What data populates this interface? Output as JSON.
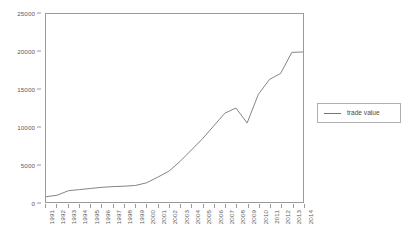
{
  "chart_data": {
    "type": "line",
    "title": "",
    "xlabel": "",
    "ylabel": "",
    "grid": false,
    "legend_position": "right",
    "ylim": [
      0,
      25000
    ],
    "ytick_labels": [
      "25000",
      "20000",
      "15000",
      "10000",
      "5000",
      "0"
    ],
    "ytick_values": [
      25000,
      20000,
      15000,
      10000,
      5000,
      0
    ],
    "categories": [
      "1991",
      "1992",
      "1993",
      "1994",
      "1995",
      "1996",
      "1997",
      "1998",
      "1999",
      "2000",
      "2001",
      "2002",
      "2003",
      "2004",
      "2005",
      "2006",
      "2007",
      "2008",
      "2009",
      "2010",
      "2011",
      "2012",
      "2013",
      "2014"
    ],
    "series": [
      {
        "name": "trade value",
        "color": "#767676",
        "values": [
          700,
          900,
          1500,
          1650,
          1800,
          1950,
          2050,
          2100,
          2200,
          2550,
          3300,
          4100,
          5400,
          6900,
          8400,
          10100,
          11800,
          12500,
          10500,
          14300,
          16300,
          17100,
          19900,
          19950
        ]
      }
    ]
  },
  "legend": {
    "entries": [
      {
        "label": "trade value",
        "color": "#767676"
      }
    ]
  }
}
